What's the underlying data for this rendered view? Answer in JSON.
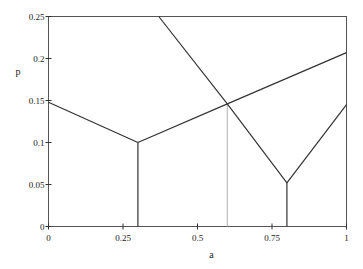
{
  "chart_data": {
    "type": "line",
    "title": "",
    "xlabel": "a",
    "ylabel": "p",
    "xlim": [
      0,
      1
    ],
    "ylim": [
      0,
      0.25
    ],
    "x_ticks": [
      "0",
      "0.25",
      "0.5",
      "0.75",
      "1"
    ],
    "y_ticks": [
      "0",
      "0.05",
      "0.1",
      "0.15",
      "0.2",
      "0.25"
    ],
    "grid": false,
    "legend": null,
    "series": [
      {
        "name": "left-V-descending",
        "color": "#333333",
        "x": [
          0,
          0.3
        ],
        "y": [
          0.148,
          0.1
        ]
      },
      {
        "name": "rising-line",
        "color": "#333333",
        "x": [
          0.3,
          0.6,
          1.0
        ],
        "y": [
          0.1,
          0.146,
          0.207
        ]
      },
      {
        "name": "steep-descending",
        "color": "#333333",
        "x": [
          0.37,
          0.6,
          0.8
        ],
        "y": [
          0.25,
          0.146,
          0.052
        ]
      },
      {
        "name": "right-V-rising",
        "color": "#333333",
        "x": [
          0.8,
          1.0
        ],
        "y": [
          0.052,
          0.145
        ]
      }
    ],
    "vertical_lines": [
      {
        "x": 0.3,
        "y_top": 0.1,
        "color": "#333333"
      },
      {
        "x": 0.6,
        "y_top": 0.146,
        "color": "#bbbbbb"
      },
      {
        "x": 0.8,
        "y_top": 0.052,
        "color": "#333333"
      }
    ]
  },
  "axes": {
    "xlabel": "a",
    "ylabel": "p"
  },
  "caption": {
    "text": ""
  }
}
